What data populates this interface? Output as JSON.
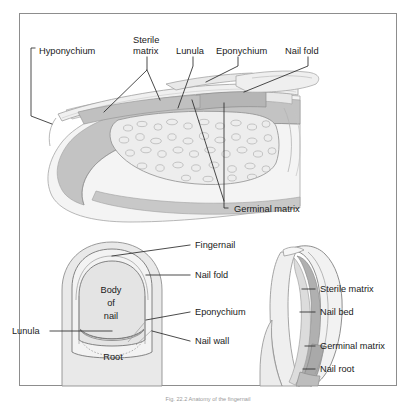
{
  "figure": {
    "caption": "Fig. 22.2 Anatomy of the fingernail",
    "frame_color": "#8d8d8d",
    "background": "#ffffff",
    "line_color": "#2b2b2b"
  },
  "palette": {
    "skin_light": "#f1f1f1",
    "skin_mid": "#e3e3e3",
    "nail_plate": "#ededed",
    "matrix_dark": "#bdbdbd",
    "matrix_mid": "#cfcfcf",
    "bone_fill": "#eaeaea",
    "trabecula": "#b9b9b9",
    "white": "#ffffff"
  },
  "panels": {
    "sagittal": {
      "name": "Sagittal section of fingertip",
      "labels": [
        {
          "id": "hyponychium",
          "text": "Hyponychium",
          "x": 39,
          "y": 51,
          "anchor": "start"
        },
        {
          "id": "sterile-matrix-line1",
          "text": "Sterile",
          "x": 131,
          "y": 41,
          "anchor": "start"
        },
        {
          "id": "sterile-matrix-line2",
          "text": "matrix",
          "x": 131,
          "y": 52,
          "anchor": "start"
        },
        {
          "id": "lunula",
          "text": "Lunula",
          "x": 180,
          "y": 51,
          "anchor": "start"
        },
        {
          "id": "eponychium",
          "text": "Eponychium",
          "x": 221,
          "y": 51,
          "anchor": "start"
        },
        {
          "id": "nail-fold",
          "text": "Nail fold",
          "x": 288,
          "y": 51,
          "anchor": "start"
        },
        {
          "id": "germinal-matrix",
          "text": "Germinal matrix",
          "x": 232,
          "y": 211,
          "anchor": "start"
        }
      ]
    },
    "dorsal": {
      "name": "Dorsal view of fingernail",
      "labels": [
        {
          "id": "fingernail",
          "text": "Fingernail",
          "x": 193,
          "y": 248,
          "anchor": "start"
        },
        {
          "id": "nail-fold",
          "text": "Nail fold",
          "x": 193,
          "y": 278,
          "anchor": "start"
        },
        {
          "id": "eponychium",
          "text": "Eponychium",
          "x": 193,
          "y": 315,
          "anchor": "start"
        },
        {
          "id": "nail-wall",
          "text": "Nail wall",
          "x": 193,
          "y": 344,
          "anchor": "start"
        },
        {
          "id": "lunula",
          "text": "Lunula",
          "x": 12,
          "y": 334,
          "anchor": "start"
        },
        {
          "id": "body-of-nail-line1",
          "text": "Body",
          "x": 111,
          "y": 290,
          "anchor": "middle"
        },
        {
          "id": "body-of-nail-line2",
          "text": "of",
          "x": 111,
          "y": 303,
          "anchor": "middle"
        },
        {
          "id": "body-of-nail-line3",
          "text": "nail",
          "x": 111,
          "y": 316,
          "anchor": "middle"
        },
        {
          "id": "root",
          "text": "Root",
          "x": 113,
          "y": 359,
          "anchor": "middle"
        }
      ]
    },
    "lateral": {
      "name": "Lateral section of fingernail",
      "labels": [
        {
          "id": "sterile-matrix",
          "text": "Sterile matrix",
          "x": 318,
          "y": 292,
          "anchor": "start"
        },
        {
          "id": "nail-bed",
          "text": "Nail bed",
          "x": 318,
          "y": 315,
          "anchor": "start"
        },
        {
          "id": "germinal-matrix",
          "text": "Germinal matrix",
          "x": 318,
          "y": 349,
          "anchor": "start"
        },
        {
          "id": "nail-root",
          "text": "Nail root",
          "x": 318,
          "y": 372,
          "anchor": "start"
        }
      ]
    }
  }
}
